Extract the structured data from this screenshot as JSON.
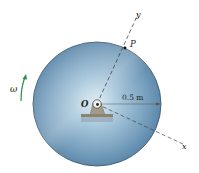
{
  "diagram": {
    "labels": {
      "omega": "ω",
      "origin": "O",
      "point": "P",
      "radius": "0.5 m",
      "x_axis": "x",
      "y_axis": "y"
    },
    "colors": {
      "disk_edge": "#2f4d66",
      "disk_light": "#cfe3ee",
      "disk_mid": "#7fa8c4",
      "disk_dark": "#3f6a8c",
      "omega_arrow": "#2e8a45",
      "support": "#9a9080",
      "axis_dash": "#333333"
    }
  }
}
